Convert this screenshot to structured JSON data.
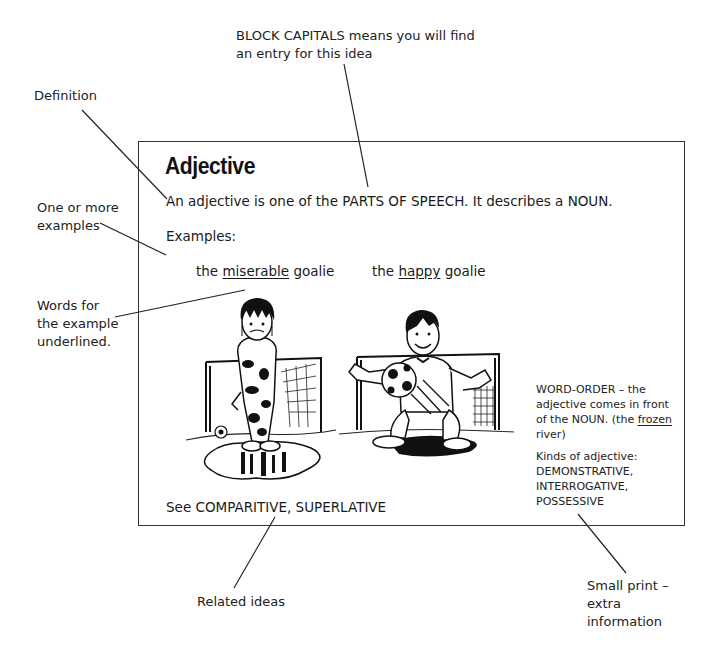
{
  "annotations": {
    "block_capitals": "BLOCK CAPITALS means you will find an entry for this idea",
    "block_capitals_line1": "BLOCK CAPITALS means you will find",
    "block_capitals_line2": "an entry for this idea",
    "definition": "Definition",
    "examples_line1": "One or more",
    "examples_line2": "examples",
    "underlined_line1": "Words for",
    "underlined_line2": "the example",
    "underlined_line3": "underlined.",
    "related": "Related ideas",
    "small_print_line1": "Small print –",
    "small_print_line2": "extra",
    "small_print_line3": "information"
  },
  "entry": {
    "title": "Adjective",
    "definition": "An adjective is one of the PARTS OF SPEECH. It describes a NOUN.",
    "examples_label": "Examples:",
    "examples": [
      {
        "prefix": "the ",
        "underlined": "miserable",
        "suffix": " goalie",
        "illustration": "miserable-goalie-illustration"
      },
      {
        "prefix": "the ",
        "underlined": "happy",
        "suffix": " goalie",
        "illustration": "happy-goalie-illustration"
      }
    ],
    "see_also": "See COMPARITIVE, SUPERLATIVE",
    "small_print": {
      "word_order_line1": "WORD-ORDER – the",
      "word_order_line2": "adjective comes in front",
      "word_order_line3_prefix": "of the NOUN. (the ",
      "word_order_line3_underlined": "frozen",
      "word_order_line4": "river)",
      "kinds_label": "Kinds of adjective:",
      "kinds": [
        "DEMONSTRATIVE,",
        "INTERROGATIVE,",
        "POSSESSIVE"
      ]
    }
  },
  "colors": {
    "ink": "#1a1a1a",
    "border": "#333333",
    "background": "#ffffff"
  }
}
